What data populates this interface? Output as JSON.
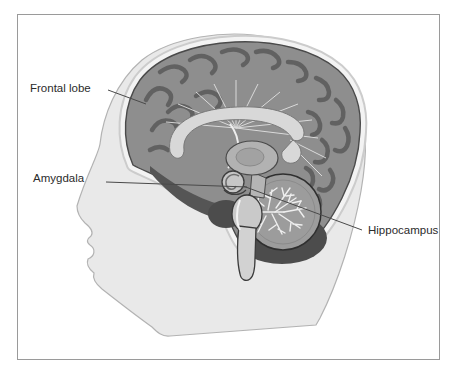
{
  "figure": {
    "type": "anatomical-diagram",
    "labels": {
      "frontal_lobe": {
        "text": "Frontal lobe",
        "target": "frontal cortex"
      },
      "amygdala": {
        "text": "Amygdala",
        "target": "amygdala structure"
      },
      "hippocampus": {
        "text": "Hippocampus",
        "target": "medial temporal region"
      }
    },
    "colors": {
      "background": "#ffffff",
      "frame_border": "#9a9a9a",
      "head_fill": "#e9e9e9",
      "head_outline": "#b3b3b3",
      "skull_band": "#f2f2f2",
      "cortex": "#8e8e8e",
      "sulci": "#606060",
      "corpus_callosum": "#d8d8d8",
      "thalamus": "#b2b2b2",
      "brainstem": "#cfcfcf",
      "cerebellum": "#9c9c9c",
      "arbor_vitae": "#efefef",
      "dark_structures": "#4c4c4c",
      "label_text": "#2b2b2b",
      "leader_line": "#4a4a4a"
    }
  }
}
